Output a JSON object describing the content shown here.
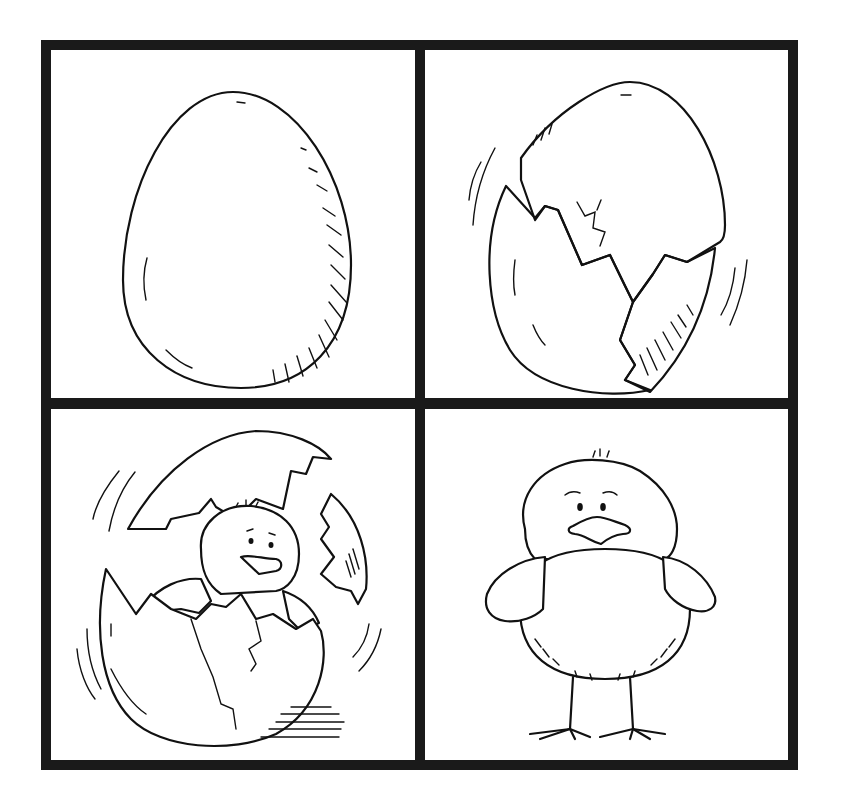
{
  "figure": {
    "layout": "2x2 grid",
    "border_color": "#1a1a1a",
    "background": "#ffffff",
    "panels": [
      {
        "position": "top-left",
        "subject": "whole egg"
      },
      {
        "position": "top-right",
        "subject": "cracking egg wobbling"
      },
      {
        "position": "bottom-left",
        "subject": "chick hatching from egg"
      },
      {
        "position": "bottom-right",
        "subject": "fluffy chick standing"
      }
    ]
  }
}
